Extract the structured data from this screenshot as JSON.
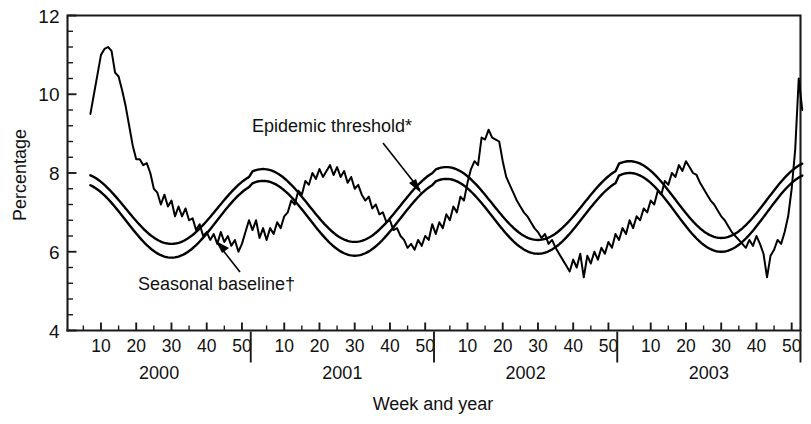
{
  "chart_data": {
    "type": "line",
    "title": "",
    "xlabel": "Week and year",
    "ylabel": "Percentage",
    "ylim": [
      4,
      12
    ],
    "ytick_labels": [
      "4",
      "6",
      "8",
      "10",
      "12"
    ],
    "ytick_values": [
      4,
      6,
      8,
      10,
      12
    ],
    "yminor_step": 0.4,
    "grid": false,
    "legend_position": "inline-annotations",
    "years": [
      "2000",
      "2001",
      "2002",
      "2003"
    ],
    "xtick_labels_per_year": [
      "10",
      "20",
      "30",
      "40",
      "50"
    ],
    "xtick_values_per_year": [
      10,
      20,
      30,
      40,
      50
    ],
    "x_start_week": 7,
    "x_end_week": 53,
    "annotations": [
      {
        "name": "epidemic-threshold",
        "text": "Epidemic threshold*",
        "points_to": "upper smooth curve, 2001 week 48"
      },
      {
        "name": "seasonal-baseline",
        "text": "Seasonal baseline†",
        "points_to": "lower smooth curve, 2000 week 44"
      }
    ],
    "series": [
      {
        "name": "Percentage of deaths due to pneumonia and influenza (observed)",
        "style": "jagged-weekly",
        "x": [
          7,
          8,
          9,
          10,
          11,
          12,
          13,
          14,
          15,
          16,
          17,
          18,
          19,
          20,
          21,
          22,
          23,
          24,
          25,
          26,
          27,
          28,
          29,
          30,
          31,
          32,
          33,
          34,
          35,
          36,
          37,
          38,
          39,
          40,
          41,
          42,
          43,
          44,
          45,
          46,
          47,
          48,
          49,
          50,
          51,
          52,
          1,
          2,
          3,
          4,
          5,
          6,
          7,
          8,
          9,
          10,
          11,
          12,
          13,
          14,
          15,
          16,
          17,
          18,
          19,
          20,
          21,
          22,
          23,
          24,
          25,
          26,
          27,
          28,
          29,
          30,
          31,
          32,
          33,
          34,
          35,
          36,
          37,
          38,
          39,
          40,
          41,
          42,
          43,
          44,
          45,
          46,
          47,
          48,
          49,
          50,
          51,
          52,
          1,
          2,
          3,
          4,
          5,
          6,
          7,
          8,
          9,
          10,
          11,
          12,
          13,
          14,
          15,
          16,
          17,
          18,
          19,
          20,
          21,
          22,
          23,
          24,
          25,
          26,
          27,
          28,
          29,
          30,
          31,
          32,
          33,
          34,
          35,
          36,
          37,
          38,
          39,
          40,
          41,
          42,
          43,
          44,
          45,
          46,
          47,
          48,
          49,
          50,
          51,
          52,
          1,
          2,
          3,
          4,
          5,
          6,
          7,
          8,
          9,
          10,
          11,
          12,
          13,
          14,
          15,
          16,
          17,
          18,
          19,
          20,
          21,
          22,
          23,
          24,
          25,
          26,
          27,
          28,
          29,
          30,
          31,
          32,
          33,
          34,
          35,
          36,
          37,
          38,
          39,
          40,
          41,
          42,
          43,
          44,
          45,
          46,
          47,
          48,
          49,
          50,
          51,
          52,
          53
        ],
        "year_index": [
          0,
          0,
          0,
          0,
          0,
          0,
          0,
          0,
          0,
          0,
          0,
          0,
          0,
          0,
          0,
          0,
          0,
          0,
          0,
          0,
          0,
          0,
          0,
          0,
          0,
          0,
          0,
          0,
          0,
          0,
          0,
          0,
          0,
          0,
          0,
          0,
          0,
          0,
          0,
          0,
          0,
          0,
          0,
          0,
          0,
          0,
          1,
          1,
          1,
          1,
          1,
          1,
          1,
          1,
          1,
          1,
          1,
          1,
          1,
          1,
          1,
          1,
          1,
          1,
          1,
          1,
          1,
          1,
          1,
          1,
          1,
          1,
          1,
          1,
          1,
          1,
          1,
          1,
          1,
          1,
          1,
          1,
          1,
          1,
          1,
          1,
          1,
          1,
          1,
          1,
          1,
          1,
          1,
          1,
          1,
          1,
          1,
          1,
          2,
          2,
          2,
          2,
          2,
          2,
          2,
          2,
          2,
          2,
          2,
          2,
          2,
          2,
          2,
          2,
          2,
          2,
          2,
          2,
          2,
          2,
          2,
          2,
          2,
          2,
          2,
          2,
          2,
          2,
          2,
          2,
          2,
          2,
          2,
          2,
          2,
          2,
          2,
          2,
          2,
          2,
          2,
          2,
          2,
          2,
          2,
          2,
          2,
          2,
          2,
          2,
          3,
          3,
          3,
          3,
          3,
          3,
          3,
          3,
          3,
          3,
          3,
          3,
          3,
          3,
          3,
          3,
          3,
          3,
          3,
          3,
          3,
          3,
          3,
          3,
          3,
          3,
          3,
          3,
          3,
          3,
          3,
          3,
          3,
          3,
          3,
          3,
          3,
          3,
          3,
          3,
          3,
          3,
          3,
          3,
          3,
          3,
          3,
          3,
          3,
          3,
          3,
          3,
          3
        ],
        "values": [
          9.5,
          10.0,
          10.5,
          11.0,
          11.15,
          11.2,
          11.1,
          10.55,
          10.45,
          10.1,
          9.7,
          9.2,
          8.7,
          8.35,
          8.35,
          8.2,
          8.25,
          8.0,
          7.6,
          7.5,
          7.2,
          7.45,
          7.15,
          7.3,
          6.9,
          7.15,
          6.9,
          7.1,
          6.8,
          6.85,
          6.55,
          6.7,
          6.4,
          6.5,
          6.3,
          6.45,
          6.2,
          6.5,
          6.25,
          6.4,
          6.15,
          6.3,
          6.0,
          6.2,
          6.5,
          6.8,
          6.55,
          6.8,
          6.35,
          6.6,
          6.3,
          6.6,
          6.45,
          6.75,
          6.6,
          6.9,
          7.0,
          7.3,
          7.2,
          7.55,
          7.45,
          7.8,
          7.7,
          8.0,
          7.85,
          8.1,
          7.9,
          8.05,
          8.2,
          7.95,
          8.15,
          7.9,
          8.05,
          7.75,
          7.9,
          7.6,
          7.7,
          7.45,
          7.3,
          7.4,
          7.1,
          7.2,
          6.95,
          7.0,
          6.75,
          6.8,
          6.55,
          6.6,
          6.4,
          6.3,
          6.1,
          6.2,
          6.05,
          6.3,
          6.15,
          6.4,
          6.3,
          6.7,
          6.45,
          6.75,
          6.6,
          6.95,
          6.8,
          7.15,
          7.0,
          7.4,
          7.3,
          7.75,
          8.1,
          8.3,
          8.2,
          8.9,
          8.85,
          9.1,
          8.9,
          8.85,
          8.8,
          8.3,
          7.9,
          7.7,
          7.5,
          7.3,
          7.15,
          7.0,
          6.9,
          6.75,
          6.6,
          6.5,
          6.35,
          6.45,
          6.2,
          6.3,
          6.1,
          5.95,
          5.8,
          5.65,
          5.5,
          5.8,
          5.6,
          5.95,
          5.35,
          5.9,
          5.7,
          6.0,
          5.8,
          6.1,
          5.95,
          6.25,
          6.1,
          6.45,
          6.3,
          6.6,
          6.45,
          6.8,
          6.6,
          6.9,
          6.8,
          7.1,
          7.0,
          7.3,
          7.2,
          7.55,
          7.45,
          7.8,
          7.7,
          8.0,
          7.9,
          8.2,
          8.05,
          8.3,
          8.15,
          8.0,
          7.95,
          7.75,
          7.6,
          7.45,
          7.3,
          7.2,
          7.05,
          6.9,
          6.8,
          6.65,
          6.5,
          6.4,
          6.3,
          6.2,
          6.1,
          6.3,
          6.15,
          6.4,
          6.2,
          5.95,
          5.35,
          5.9,
          6.05,
          6.3,
          6.2,
          6.5,
          6.9,
          7.6,
          8.6,
          10.4,
          9.6
        ]
      },
      {
        "name": "Epidemic threshold*",
        "style": "smooth-upper",
        "peak_values": [
          8.0,
          8.1,
          8.15,
          8.3
        ],
        "trough_values": [
          6.2,
          6.25,
          6.3,
          6.35
        ],
        "description": "Upper smooth sinusoidal curve, 1.645 standard deviations above seasonal baseline"
      },
      {
        "name": "Seasonal baseline†",
        "style": "smooth-lower",
        "peak_values": [
          7.75,
          7.8,
          7.85,
          8.0
        ],
        "trough_values": [
          5.85,
          5.9,
          5.95,
          6.0
        ],
        "description": "Lower smooth sinusoidal regression curve fitted to weekly percentages"
      }
    ]
  },
  "axes": {
    "y_title": "Percentage",
    "x_title": "Week and year"
  }
}
